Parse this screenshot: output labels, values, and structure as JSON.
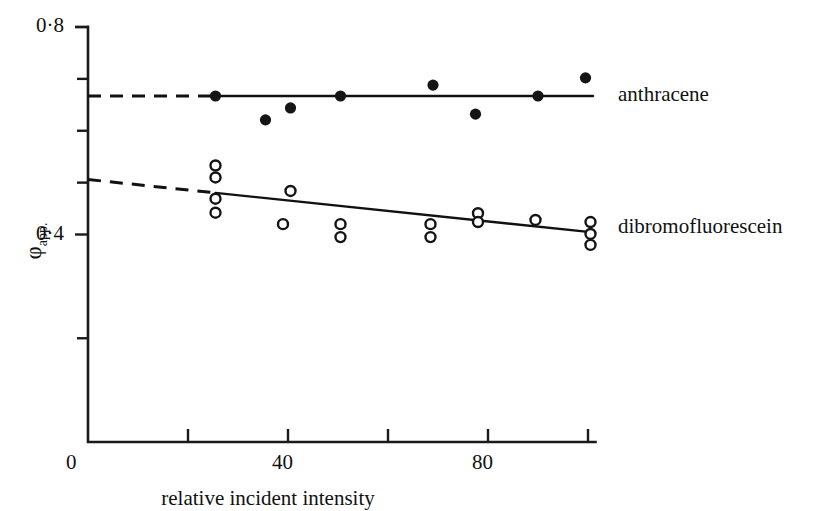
{
  "chart_data": {
    "type": "scatter",
    "title": "",
    "subtitle": "",
    "xlabel": "relative incident intensity",
    "ylabel": "φapp.",
    "ylabel_base": "φ",
    "ylabel_sub": "app.",
    "xlim": [
      0,
      102
    ],
    "ylim": [
      0,
      0.8
    ],
    "grid": false,
    "legend_position": "right-inline",
    "x_ticks": [
      0,
      20,
      40,
      60,
      80,
      100
    ],
    "x_tick_labels": [
      "0",
      "",
      "40",
      "",
      "80",
      ""
    ],
    "y_ticks": [
      0,
      0.2,
      0.4,
      0.5,
      0.6,
      0.7,
      0.8
    ],
    "y_tick_labels": [
      "0",
      "",
      "0·4",
      "",
      "",
      "",
      "0·8"
    ],
    "series": [
      {
        "name": "anthracene",
        "marker": "filled-circle",
        "color": "#141414",
        "label": "anthracene",
        "points": [
          {
            "x": 25.5,
            "y": 0.667
          },
          {
            "x": 35.5,
            "y": 0.621
          },
          {
            "x": 40.5,
            "y": 0.644
          },
          {
            "x": 50.5,
            "y": 0.667
          },
          {
            "x": 69.0,
            "y": 0.688
          },
          {
            "x": 77.5,
            "y": 0.632
          },
          {
            "x": 90.0,
            "y": 0.667
          },
          {
            "x": 99.5,
            "y": 0.702
          }
        ],
        "fit": {
          "solid_from_x": 25.5,
          "solid_to_x": 101.0,
          "dashed_from_x": 0.0,
          "dashed_to_x": 25.5,
          "y_at_x0": 0.667,
          "y_at_x100": 0.667
        }
      },
      {
        "name": "dibromofluorescein",
        "marker": "open-circle",
        "color": "#141414",
        "label": "dibromofluorescein",
        "points": [
          {
            "x": 25.5,
            "y": 0.533
          },
          {
            "x": 25.5,
            "y": 0.51
          },
          {
            "x": 25.5,
            "y": 0.469
          },
          {
            "x": 25.5,
            "y": 0.442
          },
          {
            "x": 39.0,
            "y": 0.42
          },
          {
            "x": 40.5,
            "y": 0.484
          },
          {
            "x": 50.5,
            "y": 0.42
          },
          {
            "x": 50.5,
            "y": 0.395
          },
          {
            "x": 68.5,
            "y": 0.42
          },
          {
            "x": 68.5,
            "y": 0.395
          },
          {
            "x": 78.0,
            "y": 0.441
          },
          {
            "x": 78.0,
            "y": 0.424
          },
          {
            "x": 89.5,
            "y": 0.428
          },
          {
            "x": 100.5,
            "y": 0.424
          },
          {
            "x": 100.5,
            "y": 0.401
          },
          {
            "x": 100.5,
            "y": 0.38
          }
        ],
        "fit": {
          "solid_from_x": 25.5,
          "solid_to_x": 101.0,
          "dashed_from_x": 0.0,
          "dashed_to_x": 25.5,
          "y_at_x0": 0.506,
          "y_at_x100": 0.405
        }
      }
    ]
  },
  "axes": {
    "x_axis_name": "relative incident intensity",
    "y_axis_name": "phi-apparent"
  },
  "legend": {
    "anthracene_label": "anthracene",
    "dibromofluorescein_label": "dibromofluorescein"
  }
}
